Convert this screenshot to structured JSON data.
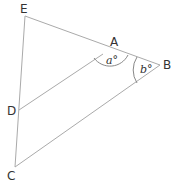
{
  "diagram": {
    "points": {
      "E": {
        "label": "E",
        "x": 25,
        "y": 16
      },
      "A": {
        "label": "A",
        "x": 108,
        "y": 51
      },
      "B": {
        "label": "B",
        "x": 160,
        "y": 65
      },
      "D": {
        "label": "D",
        "x": 19,
        "y": 110
      },
      "C": {
        "label": "C",
        "x": 15,
        "y": 167
      }
    },
    "segments": [
      [
        "E",
        "B"
      ],
      [
        "E",
        "C"
      ],
      [
        "D",
        "A"
      ],
      [
        "C",
        "B"
      ]
    ],
    "angles": {
      "a": {
        "label": "a°",
        "vertex": "A"
      },
      "b": {
        "label": "b°",
        "vertex": "B"
      }
    },
    "line_color": "#aaaaaa",
    "text_color": "#333333"
  }
}
